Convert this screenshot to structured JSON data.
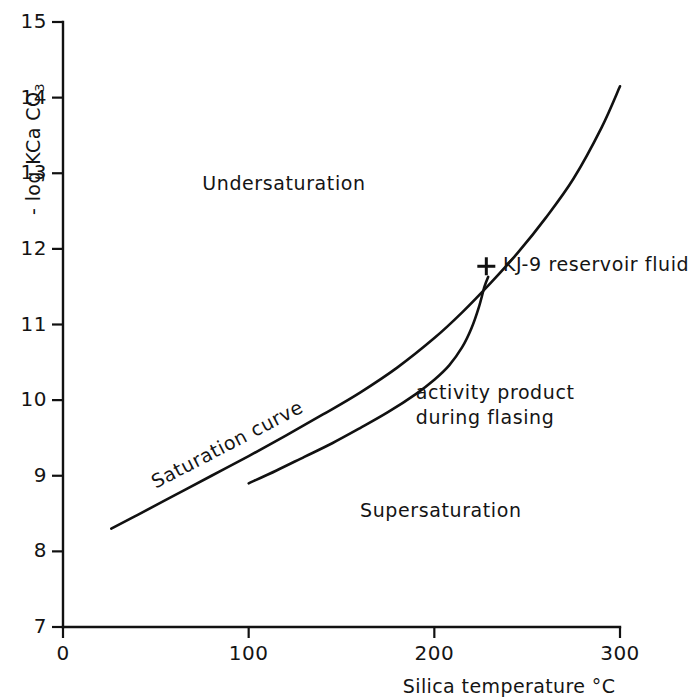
{
  "figure": {
    "background_color": "#ffffff",
    "ink_color": "#111111"
  },
  "chart_data": {
    "type": "line",
    "title": "",
    "subtitle": "",
    "xlabel": "Silica temperature °C",
    "ylabel": "- log K Ca CO3",
    "ylabel_parts": {
      "prefix": "- log K",
      "species": "Ca CO",
      "subscript": "3"
    },
    "xlim": [
      0,
      300
    ],
    "ylim": [
      7,
      15
    ],
    "xticks": [
      0,
      100,
      200,
      300
    ],
    "xtick_labels": [
      "0",
      "100",
      "200",
      "300"
    ],
    "yticks": [
      7,
      8,
      9,
      10,
      11,
      12,
      13,
      14,
      15
    ],
    "ytick_labels": [
      "7",
      "8",
      "9",
      "10",
      "11",
      "12",
      "13",
      "14",
      "15"
    ],
    "grid": false,
    "legend": "none",
    "series": [
      {
        "name": "Saturation curve",
        "style": "solid-line",
        "x": [
          26,
          40,
          60,
          80,
          100,
          120,
          140,
          160,
          180,
          200,
          215,
          230,
          245,
          260,
          275,
          290,
          300
        ],
        "y": [
          8.3,
          8.48,
          8.74,
          9.0,
          9.26,
          9.53,
          9.81,
          10.1,
          10.43,
          10.82,
          11.16,
          11.54,
          11.95,
          12.41,
          12.93,
          13.6,
          14.15
        ]
      },
      {
        "name": "activity product during flasing",
        "style": "solid-line",
        "x": [
          100,
          115,
          130,
          145,
          160,
          175,
          190,
          200,
          208,
          215,
          220,
          224,
          227,
          229
        ],
        "y": [
          8.9,
          9.07,
          9.25,
          9.43,
          9.63,
          9.84,
          10.08,
          10.27,
          10.46,
          10.7,
          10.95,
          11.23,
          11.5,
          11.63
        ]
      }
    ],
    "points": [
      {
        "name": "KJ-9 reservoir fluid",
        "marker": "plus",
        "x": 228,
        "y": 11.77
      }
    ],
    "annotations": [
      {
        "name": "undersaturation",
        "text": "Undersaturation",
        "x": 75,
        "y": 12.85,
        "rotation": 0
      },
      {
        "name": "supersaturation",
        "text": "Supersaturation",
        "x": 160,
        "y": 8.52,
        "rotation": 0
      },
      {
        "name": "saturation-curve",
        "text": "Saturation curve",
        "x": 45,
        "y": 9.05,
        "rotation": -27.5
      },
      {
        "name": "activity-product",
        "text": "activity product during flasing",
        "line1": "activity product",
        "line2": "during flasing",
        "x": 190,
        "y": 10.05,
        "rotation": 0
      },
      {
        "name": "kj9-point-label",
        "text": "KJ-9 reservoir fluid",
        "x": 237,
        "y": 11.77,
        "rotation": 0
      }
    ]
  },
  "labels": {
    "x_axis_title": "Silica temperature °C",
    "y_axis_prefix": "- log K",
    "y_axis_species": "Ca CO",
    "y_axis_subscript": "3",
    "undersaturation": "Undersaturation",
    "supersaturation": "Supersaturation",
    "saturation_curve": "Saturation curve",
    "activity_line1": "activity product",
    "activity_line2": "during flasing",
    "kj9": "KJ-9 reservoir fluid"
  }
}
